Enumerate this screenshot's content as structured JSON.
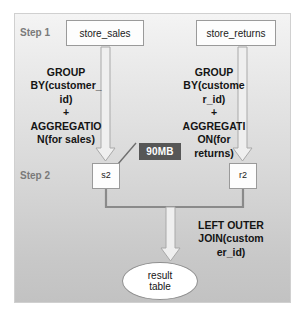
{
  "diagram": {
    "steps": [
      {
        "id": "step-1",
        "label": "Step 1"
      },
      {
        "id": "step-2",
        "label": "Step 2"
      }
    ],
    "sources": [
      {
        "id": "store-sales",
        "label": "store_sales"
      },
      {
        "id": "store-returns",
        "label": "store_returns"
      }
    ],
    "operations": [
      {
        "id": "op-left",
        "text": "GROUP\nBY(customer_\nid)\n+\nAGGREGATIO\nN(for sales)"
      },
      {
        "id": "op-right",
        "text": "GROUP\nBY(custome\nr_id)\n+\nAGGREGATI\nON(for\nreturns)"
      },
      {
        "id": "op-join",
        "text": "LEFT OUTER\nJOIN(custom\ner_id)"
      }
    ],
    "intermediates": [
      {
        "id": "s2",
        "label": "s2"
      },
      {
        "id": "r2",
        "label": "r2"
      }
    ],
    "annotations": [
      {
        "id": "data-size",
        "label": "90MB",
        "color": "#575757",
        "text_color": "#ffffff",
        "attached_to": "s2"
      }
    ],
    "result": {
      "id": "result-table",
      "line1": "result",
      "line2": "table"
    },
    "colors": {
      "panel_top": "#f4f4f4",
      "panel_bottom": "#c2c2c2",
      "node_fill": "#fdfdfd",
      "node_border": "#9a9a9a",
      "arrow_fill": "#efefef",
      "arrow_border": "#a9a9a9",
      "connector": "#8a8a8a",
      "step_text": "#7a7a7a",
      "body_text": "#141414",
      "badge_fill": "#575757"
    }
  }
}
